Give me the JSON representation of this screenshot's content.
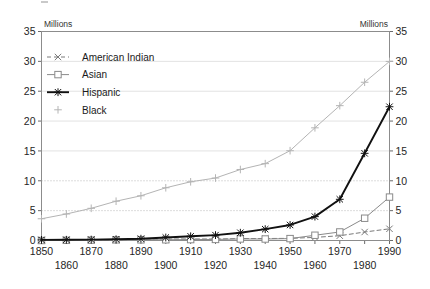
{
  "axes": {
    "left_unit_label": "Millions",
    "right_unit_label": "Millions",
    "y_ticks": [
      "0",
      "5",
      "10",
      "15",
      "20",
      "25",
      "30",
      "35"
    ],
    "x_ticks_upper": [
      "1850",
      "1870",
      "1890",
      "1910",
      "1930",
      "1950",
      "1970",
      "1990"
    ],
    "x_ticks_lower": [
      "1860",
      "1880",
      "1900",
      "1920",
      "1940",
      "1960",
      "1980"
    ]
  },
  "legend": {
    "position": "inside-upper-left",
    "entries": [
      {
        "label": "American Indian",
        "marker": "x-marker-icon",
        "color": "#7a7a7a",
        "dash": "4 3"
      },
      {
        "label": "Asian",
        "marker": "square-marker-icon",
        "color": "#8a8a8a",
        "dash": "none"
      },
      {
        "label": "Hispanic",
        "marker": "asterisk-marker-icon",
        "color": "#111111",
        "dash": "none"
      },
      {
        "label": "Black",
        "marker": "plus-marker-icon",
        "color": "#b4b4b4",
        "dash": "none"
      }
    ]
  },
  "chart_data": {
    "type": "line",
    "title": "",
    "subtitle": "",
    "xlabel": "",
    "ylabel": "Millions",
    "y2label": "Millions",
    "xlim": [
      1850,
      1990
    ],
    "ylim": [
      0,
      35
    ],
    "ytick_step": 5,
    "xtick_step": 10,
    "grid": "horizontal-faint",
    "legend_position": "upper-left-inside",
    "x": [
      1850,
      1860,
      1870,
      1880,
      1890,
      1900,
      1910,
      1920,
      1930,
      1940,
      1950,
      1960,
      1970,
      1980,
      1990
    ],
    "series": [
      {
        "name": "American Indian",
        "marker": "x",
        "linestyle": "dashed",
        "color": "#7a7a7a",
        "values": [
          0.05,
          0.05,
          0.05,
          0.07,
          0.25,
          0.24,
          0.27,
          0.24,
          0.33,
          0.33,
          0.36,
          0.52,
          0.8,
          1.42,
          1.96
        ]
      },
      {
        "name": "Asian",
        "marker": "square",
        "linestyle": "solid",
        "color": "#8a8a8a",
        "values": [
          0.0,
          0.03,
          0.06,
          0.11,
          0.11,
          0.12,
          0.15,
          0.18,
          0.26,
          0.25,
          0.32,
          0.88,
          1.43,
          3.73,
          7.27
        ]
      },
      {
        "name": "Hispanic",
        "marker": "asterisk",
        "linestyle": "solid-bold",
        "color": "#111111",
        "values": [
          0.1,
          0.12,
          0.15,
          0.2,
          0.3,
          0.5,
          0.7,
          0.9,
          1.3,
          1.9,
          2.6,
          4.0,
          6.9,
          14.6,
          22.4
        ]
      },
      {
        "name": "Black",
        "marker": "plus",
        "linestyle": "solid",
        "color": "#b4b4b4",
        "values": [
          3.64,
          4.44,
          5.39,
          6.58,
          7.49,
          8.83,
          9.83,
          10.46,
          11.89,
          12.87,
          15.04,
          18.87,
          22.58,
          26.5,
          29.99
        ]
      }
    ]
  }
}
